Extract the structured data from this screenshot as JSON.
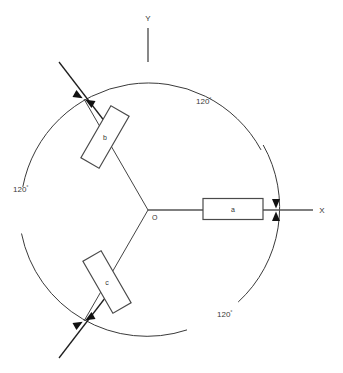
{
  "diagram": {
    "background_color": "#ffffff",
    "line_color": "#3a3a3a",
    "marker_color": "#111111",
    "center": {
      "x": 148,
      "y": 210,
      "label": "O"
    },
    "circle": {
      "cx": 148,
      "cy": 210,
      "r": 128
    },
    "axes": [
      {
        "name": "x-axis",
        "label": "X",
        "label_x": 323,
        "label_y": 212,
        "from_x": 148,
        "from_y": 210,
        "to_x": 313,
        "to_y": 210
      },
      {
        "name": "y-axis",
        "label": "Y",
        "label_x": 148,
        "label_y": 20,
        "from_x": 148,
        "from_y": 28,
        "to_x": 148,
        "to_y": 62
      }
    ],
    "arms": [
      {
        "name": "arm-a",
        "box_label": "a",
        "angle_deg": 0,
        "box_center_x": 233,
        "box_center_y": 209,
        "box_w": 60,
        "box_h": 21
      },
      {
        "name": "arm-b",
        "box_label": "b",
        "angle_deg": 120,
        "box_center_x": 105,
        "box_center_y": 137,
        "box_w": 60,
        "box_h": 21
      },
      {
        "name": "arm-c",
        "box_label": "c",
        "angle_deg": 240,
        "box_center_x": 107,
        "box_center_y": 282,
        "box_w": 60,
        "box_h": 21
      }
    ],
    "angle_labels": [
      {
        "name": "angle-label-top-right",
        "value": "120",
        "unit": "°",
        "x": 197,
        "y": 101
      },
      {
        "name": "angle-label-left",
        "value": "120",
        "unit": "°",
        "x": 14,
        "y": 190
      },
      {
        "name": "angle-label-bottom-right",
        "value": "120",
        "unit": "°",
        "x": 218,
        "y": 315
      }
    ],
    "markers": [
      {
        "name": "crossing-marker-a",
        "x": 276,
        "y": 210,
        "rotation_deg": 0
      },
      {
        "name": "crossing-marker-b",
        "x": 84,
        "y": 98,
        "rotation_deg": 120
      },
      {
        "name": "crossing-marker-c",
        "x": 84,
        "y": 322,
        "rotation_deg": 240
      }
    ],
    "tangent_lines": [
      {
        "name": "tangent-line-b",
        "x1": 60,
        "y1": 63,
        "x2": 110,
        "y2": 129
      },
      {
        "name": "tangent-line-c",
        "x1": 60,
        "y1": 357,
        "x2": 110,
        "y2": 291
      }
    ]
  }
}
